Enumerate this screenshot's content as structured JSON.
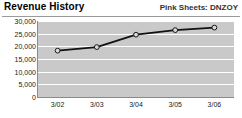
{
  "header": {
    "title": "Revenue History",
    "ticker": "Pink Sheets: DNZOY"
  },
  "chart_data": {
    "type": "line",
    "title": "Revenue History",
    "subtitle": "Pink Sheets: DNZOY",
    "xlabel": "",
    "ylabel": "",
    "categories": [
      "3/02",
      "3/03",
      "3/04",
      "3/05",
      "3/06"
    ],
    "values": [
      18300,
      19700,
      24600,
      26400,
      27400
    ],
    "series": [
      {
        "name": "Revenue",
        "values": [
          18300,
          19700,
          24600,
          26400,
          27400
        ]
      }
    ],
    "ylim": [
      0,
      30000
    ],
    "yticks": [
      0,
      5000,
      10000,
      15000,
      20000,
      25000,
      30000
    ],
    "ytick_labels": [
      "0",
      "5,000",
      "10,000",
      "15,000",
      "20,000",
      "25,000",
      "30,000"
    ],
    "xtick_labels": [
      "3/02",
      "3/03",
      "3/04",
      "3/05",
      "3/06"
    ],
    "grid": true,
    "legend": "none",
    "colors": {
      "plot_background": "#c9c9c9",
      "gridline": "#ffffff",
      "line": "#111111",
      "marker_fill": "#d8d8d8",
      "marker_stroke": "#1a1a1a",
      "text": "#222222",
      "card_background": "#ffffff"
    }
  }
}
